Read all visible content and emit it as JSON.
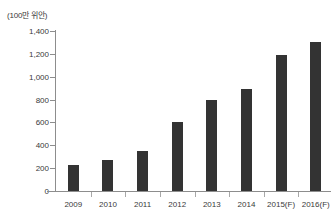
{
  "chart_data": {
    "type": "bar",
    "title": "",
    "subtitle": "",
    "unit_label": "(100만 위안)",
    "xlabel": "",
    "ylabel": "",
    "categories": [
      "2009",
      "2010",
      "2011",
      "2012",
      "2013",
      "2014",
      "2015(F)",
      "2016(F)"
    ],
    "values": [
      230,
      270,
      350,
      600,
      800,
      890,
      1190,
      1300
    ],
    "series": [
      {
        "name": "",
        "values": [
          230,
          270,
          350,
          600,
          800,
          890,
          1190,
          1300
        ]
      }
    ],
    "ylim": [
      0,
      1400
    ],
    "ytick_values": [
      0,
      200,
      400,
      600,
      800,
      1000,
      1200,
      1400
    ],
    "ytick_labels": [
      "0",
      "200",
      "400",
      "600",
      "800",
      "1,000",
      "1,200",
      "1,400"
    ],
    "grid": false,
    "legend": false,
    "legend_position": "none",
    "bar_color": "#333333",
    "axis_color": "#8d8d8d",
    "text_color": "#3a3a3a",
    "background_color": "#ffffff"
  }
}
